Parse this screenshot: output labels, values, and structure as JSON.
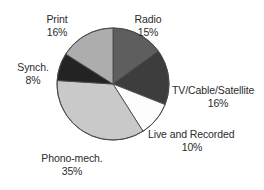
{
  "chart_data": {
    "type": "pie",
    "title": "",
    "subtitle": "",
    "xlabel": "",
    "ylabel": "",
    "legend_position": "none",
    "grid": false,
    "labels_outside": true,
    "start_angle_deg": 0,
    "direction": "clockwise",
    "categories": [
      "Radio",
      "TV/Cable/Satellite",
      "Live and Recorded",
      "Phono-mech.",
      "Synch.",
      "Print"
    ],
    "values": [
      15,
      16,
      10,
      35,
      8,
      16
    ],
    "value_unit": "%",
    "slices": [
      {
        "id": "radio",
        "name": "Radio",
        "value": 15,
        "value_text": "15%",
        "color": "#5e5e5e",
        "start_pct": 0,
        "end_pct": 15
      },
      {
        "id": "tv",
        "name": "TV/Cable/Satellite",
        "value": 16,
        "value_text": "16%",
        "color": "#3d3d3d",
        "start_pct": 15,
        "end_pct": 31
      },
      {
        "id": "live",
        "name": "Live and Recorded",
        "value": 10,
        "value_text": "10%",
        "color": "#fdfdfd",
        "start_pct": 31,
        "end_pct": 41
      },
      {
        "id": "phono",
        "name": "Phono-mech.",
        "value": 35,
        "value_text": "35%",
        "color": "#c9c9c9",
        "start_pct": 41,
        "end_pct": 76
      },
      {
        "id": "synch",
        "name": "Synch.",
        "value": 8,
        "value_text": "8%",
        "color": "#232323",
        "start_pct": 76,
        "end_pct": 84
      },
      {
        "id": "print",
        "name": "Print",
        "value": 16,
        "value_text": "16%",
        "color": "#adadad",
        "start_pct": 84,
        "end_pct": 100
      }
    ],
    "geometry": {
      "center_x": 113,
      "center_y": 84,
      "radius": 56,
      "stroke_color": "#4a4a4a",
      "stroke_width": 0.9
    },
    "colors": {
      "background": "#ffffff",
      "text": "#2b2b2b",
      "outline": "#4a4a4a"
    }
  }
}
